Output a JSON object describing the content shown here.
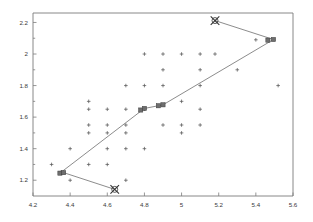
{
  "chart_data": {
    "type": "scatter",
    "title": "",
    "xlabel": "",
    "ylabel": "",
    "xlim": [
      4.2,
      5.6
    ],
    "ylim": [
      1.1,
      2.26
    ],
    "grid": false,
    "legend": "none",
    "xticks": [
      4.2,
      4.4,
      4.6,
      4.8,
      5.0,
      5.2,
      5.4,
      5.6
    ],
    "xticklabels": [
      "4.2",
      "4.4",
      "4.6",
      "4.8",
      "5",
      "5.2",
      "5.4",
      "5.6"
    ],
    "yticks": [
      1.2,
      1.4,
      1.6,
      1.8,
      2.0,
      2.2
    ],
    "yticklabels": [
      "1.2",
      "1.4",
      "1.6",
      "1.8",
      "2",
      "2.2"
    ],
    "y_minor_ticks": [
      1.3,
      1.5,
      1.7,
      1.9,
      2.1
    ],
    "series": [
      {
        "name": "data-points",
        "marker": "plus",
        "color": "#555555",
        "points": [
          [
            4.3,
            1.3
          ],
          [
            4.35,
            1.25
          ],
          [
            4.4,
            1.4
          ],
          [
            4.4,
            1.2
          ],
          [
            4.5,
            1.7
          ],
          [
            4.5,
            1.65
          ],
          [
            4.5,
            1.55
          ],
          [
            4.5,
            1.5
          ],
          [
            4.5,
            1.3
          ],
          [
            4.6,
            1.65
          ],
          [
            4.6,
            1.55
          ],
          [
            4.6,
            1.5
          ],
          [
            4.6,
            1.4
          ],
          [
            4.6,
            1.3
          ],
          [
            4.7,
            1.8
          ],
          [
            4.7,
            1.65
          ],
          [
            4.7,
            1.55
          ],
          [
            4.7,
            1.5
          ],
          [
            4.7,
            1.4
          ],
          [
            4.7,
            1.2
          ],
          [
            4.8,
            2.0
          ],
          [
            4.8,
            1.8
          ],
          [
            4.8,
            1.65
          ],
          [
            4.8,
            1.4
          ],
          [
            4.9,
            2.0
          ],
          [
            4.9,
            1.9
          ],
          [
            4.9,
            1.8
          ],
          [
            4.9,
            1.55
          ],
          [
            5.0,
            2.0
          ],
          [
            5.0,
            1.7
          ],
          [
            5.0,
            1.55
          ],
          [
            5.0,
            1.5
          ],
          [
            5.1,
            2.0
          ],
          [
            5.1,
            1.9
          ],
          [
            5.1,
            1.8
          ],
          [
            5.1,
            1.65
          ],
          [
            5.1,
            1.55
          ],
          [
            5.18,
            2.0
          ],
          [
            5.3,
            1.9
          ],
          [
            5.4,
            2.09
          ],
          [
            5.52,
            1.8
          ]
        ]
      },
      {
        "name": "cluster-centroids",
        "marker": "square",
        "color": "#6e6e6e",
        "points": [
          [
            4.345,
            1.245
          ],
          [
            4.365,
            1.248
          ],
          [
            4.78,
            1.645
          ],
          [
            4.8,
            1.655
          ],
          [
            4.875,
            1.672
          ],
          [
            4.9,
            1.678
          ],
          [
            5.465,
            2.088
          ],
          [
            5.495,
            2.092
          ]
        ]
      },
      {
        "name": "outlier-crosses",
        "marker": "x-circle",
        "color": "#303030",
        "points": [
          [
            5.18,
            2.212
          ],
          [
            4.64,
            1.142
          ]
        ]
      }
    ],
    "paths": [
      {
        "name": "main-trajectory",
        "style": "solid",
        "points": [
          [
            4.345,
            1.245
          ],
          [
            4.8,
            1.655
          ],
          [
            4.9,
            1.678
          ],
          [
            5.495,
            2.092
          ],
          [
            5.18,
            2.212
          ]
        ]
      },
      {
        "name": "branch-trajectory",
        "style": "solid",
        "points": [
          [
            4.365,
            1.248
          ],
          [
            4.64,
            1.142
          ]
        ]
      }
    ]
  }
}
